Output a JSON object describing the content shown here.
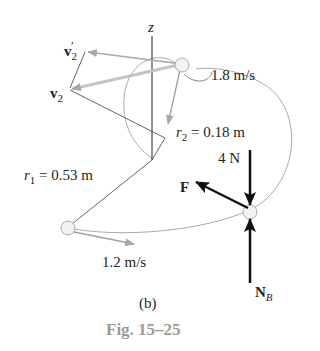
{
  "figure": {
    "caption": "Fig. 15–25",
    "part_label": "(b)"
  },
  "labels": {
    "z_axis": "z",
    "v2_prime": {
      "base": "v",
      "sub": "2",
      "prime": "′"
    },
    "v2": {
      "base": "v",
      "sub": "2"
    },
    "speed_top": "1.8 m/s",
    "r2": {
      "var": "r",
      "sub": "2",
      "value": " = 0.18 m"
    },
    "r1": {
      "var": "r",
      "sub": "1",
      "value": " = 0.53 m"
    },
    "force_weight": "4 N",
    "force_F": "F",
    "speed_bottom": "1.2 m/s",
    "normal": {
      "base": "N",
      "sub": "B"
    }
  },
  "colors": {
    "ink": "#231f20",
    "gray_line": "#9a9a9a",
    "caption": "#9a9a9a"
  }
}
